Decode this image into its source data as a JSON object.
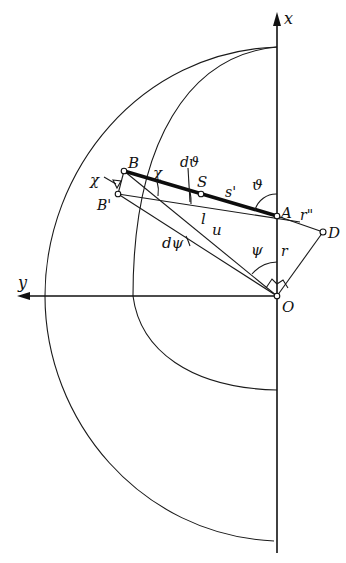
{
  "figure": {
    "type": "geometric-kinematics-diagram",
    "axes": {
      "x_label": "x",
      "y_label": "y"
    },
    "points": {
      "O": "O",
      "A": "A",
      "B": "B",
      "B_prime": "B'",
      "S": "S",
      "D": "D"
    },
    "segment_labels": {
      "s_prime": "s'",
      "l": "l",
      "u": "u",
      "r": "r",
      "r_double_prime": "r\""
    },
    "angle_labels": {
      "theta": "ϑ",
      "d_theta": "dϑ",
      "psi": "ψ",
      "d_psi": "dψ",
      "chi_at_B": "χ",
      "chi_outer": "χ"
    },
    "curves": [
      "outer-semicircle",
      "inner-semicircle"
    ],
    "colors": {
      "ink": "#111111",
      "paper": "#ffffff"
    }
  }
}
